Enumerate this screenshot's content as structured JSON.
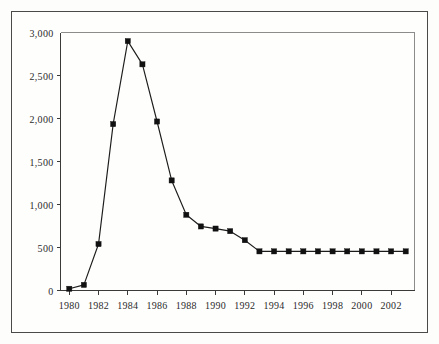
{
  "chart_data": {
    "type": "line",
    "title": "",
    "subtitle": "",
    "xlabel": "",
    "ylabel": "",
    "x": [
      1980,
      1981,
      1982,
      1983,
      1984,
      1985,
      1986,
      1987,
      1988,
      1989,
      1990,
      1991,
      1992,
      1993,
      1994,
      1995,
      1996,
      1997,
      1998,
      1999,
      2000,
      2001,
      2002,
      2003
    ],
    "values": [
      20,
      65,
      540,
      1935,
      2900,
      2630,
      1965,
      1280,
      880,
      745,
      720,
      690,
      585,
      455,
      455,
      455,
      455,
      455,
      455,
      455,
      455,
      455,
      455,
      455
    ],
    "series": [
      {
        "name": "",
        "values": [
          20,
          65,
          540,
          1935,
          2900,
          2630,
          1965,
          1280,
          880,
          745,
          720,
          690,
          585,
          455,
          455,
          455,
          455,
          455,
          455,
          455,
          455,
          455,
          455,
          455
        ]
      }
    ],
    "xlim": [
      1979.4,
      2003.6
    ],
    "ylim": [
      0,
      3000
    ],
    "ytick_values": [
      0,
      500,
      1000,
      1500,
      2000,
      2500,
      3000
    ],
    "ytick_labels": [
      "0",
      "500",
      "1,000",
      "1,500",
      "2,000",
      "2,500",
      "3,000"
    ],
    "xtick_values": [
      1980,
      1982,
      1984,
      1986,
      1988,
      1990,
      1992,
      1994,
      1996,
      1998,
      2000,
      2002
    ],
    "xtick_labels": [
      "1980",
      "1982",
      "1984",
      "1986",
      "1988",
      "1990",
      "1992",
      "1994",
      "1996",
      "1998",
      "2000",
      "2002"
    ],
    "xtick_minor_values": [
      1981,
      1983,
      1985,
      1987,
      1989,
      1991,
      1993,
      1995,
      1997,
      1999,
      2001,
      2003
    ],
    "grid": false,
    "legend": false,
    "legend_position": "none",
    "marker": "square",
    "line_color": "#1c1c1c",
    "marker_color": "#111111",
    "axis_color": "#3a3a3a",
    "background_color": "#fefefd",
    "frame_color": "#4a4a4a",
    "annotations": []
  }
}
